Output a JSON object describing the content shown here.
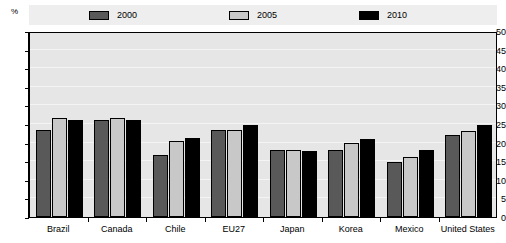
{
  "chart_data": {
    "type": "bar",
    "title": "",
    "xlabel": "",
    "ylabel": "%",
    "ylim": [
      0,
      50
    ],
    "ytick_step": 5,
    "yticks": [
      0,
      5,
      10,
      15,
      20,
      25,
      30,
      35,
      40,
      45,
      50
    ],
    "grid": true,
    "legend_position": "top",
    "categories": [
      "Brazil",
      "Canada",
      "Chile",
      "EU27",
      "Japan",
      "Korea",
      "Mexico",
      "United States"
    ],
    "series": [
      {
        "name": "2000",
        "color": "#595959",
        "values": [
          23.5,
          26.0,
          16.7,
          23.3,
          18.0,
          18.0,
          14.8,
          22.0
        ]
      },
      {
        "name": "2005",
        "color": "#c8c8c8",
        "values": [
          26.5,
          26.7,
          20.5,
          23.5,
          18.0,
          20.0,
          16.0,
          23.0
        ]
      },
      {
        "name": "2010",
        "color": "#000000",
        "values": [
          26.0,
          26.0,
          21.3,
          24.7,
          17.7,
          21.0,
          18.0,
          24.7
        ]
      }
    ]
  },
  "axis": {
    "unit_label": "%"
  },
  "colors": {
    "plot_background": "#e6e6e6",
    "legend_background": "#eeeeee",
    "frame": "#000000",
    "gridline": "#f4f4f4"
  }
}
